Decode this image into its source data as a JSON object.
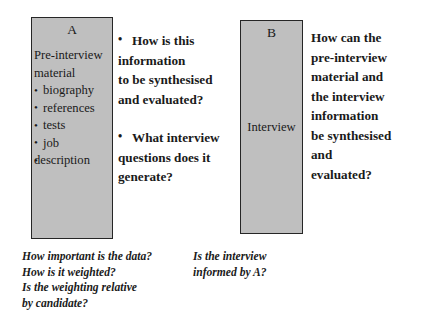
{
  "diagram": {
    "background_color": "#ffffff",
    "box_fill_color": "#bfbfbf",
    "box_border_color": "#262626",
    "text_color": "#1a1a1a"
  },
  "box_a": {
    "letter": "A",
    "lead_line_1": "Pre-interview",
    "lead_line_2": "material",
    "items": [
      "biography",
      "references",
      "tests",
      "job",
      "description"
    ]
  },
  "box_b": {
    "letter": "B",
    "label": "Interview"
  },
  "middle_column": {
    "questions": [
      {
        "line_1": "How is this",
        "line_2": "information",
        "line_3": "to be synthesised",
        "line_4": "and evaluated?"
      },
      {
        "line_1": "What interview",
        "line_2": "questions does it",
        "line_3": "generate?"
      }
    ]
  },
  "right_column": {
    "question": {
      "line_1": "How can the",
      "line_2": "pre-interview",
      "line_3": "material and",
      "line_4": "the interview",
      "line_5": "information",
      "line_6": "be synthesised",
      "line_7": "and",
      "line_8": "evaluated?"
    }
  },
  "notes": {
    "left": [
      "How important is the data?",
      "How is it weighted?",
      "Is the weighting relative",
      "by candidate?"
    ],
    "right": [
      "Is the interview",
      "informed by A?"
    ]
  }
}
